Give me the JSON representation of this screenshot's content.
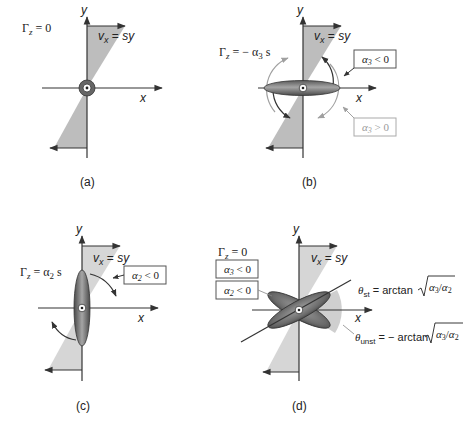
{
  "figure": {
    "colors": {
      "axis": "#333333",
      "shade": "#bcbcbc",
      "shade_light": "#d9d9d9",
      "ellipse_dark": "#555555",
      "ellipse_mid": "#8a8a8a",
      "arrow_gray": "#999999",
      "box_border": "#555555",
      "box_border_light": "#aaaaaa",
      "text_light": "#9a9a9a"
    },
    "panels": [
      {
        "id": "a",
        "caption": "(a)",
        "gamma_label": "Γz = 0",
        "flow_label": "vx = sy",
        "x_axis": "x",
        "y_axis": "y"
      },
      {
        "id": "b",
        "caption": "(b)",
        "gamma_label": "Γz = − α3 s",
        "flow_label": "vx = sy",
        "x_axis": "x",
        "y_axis": "y",
        "annotations": [
          {
            "text": "α3 < 0",
            "style": "dark"
          },
          {
            "text": "α3 > 0",
            "style": "light"
          }
        ]
      },
      {
        "id": "c",
        "caption": "(c)",
        "gamma_label": "Γz = α2 s",
        "flow_label": "vx = sy",
        "x_axis": "x",
        "y_axis": "y",
        "annotations": [
          {
            "text": "α2 < 0",
            "style": "dark"
          }
        ]
      },
      {
        "id": "d",
        "caption": "(d)",
        "gamma_label": "Γz = 0",
        "flow_label": "vx = sy",
        "x_axis": "x",
        "y_axis": "y",
        "annotations": [
          {
            "text": "α3 < 0",
            "style": "dark"
          },
          {
            "text": "α2 < 0",
            "style": "dark"
          }
        ],
        "angle_labels": {
          "stable": "θst = arctan √(α3/α2)",
          "unstable": "θunst = − arctan √(α3/α2)"
        }
      }
    ]
  }
}
